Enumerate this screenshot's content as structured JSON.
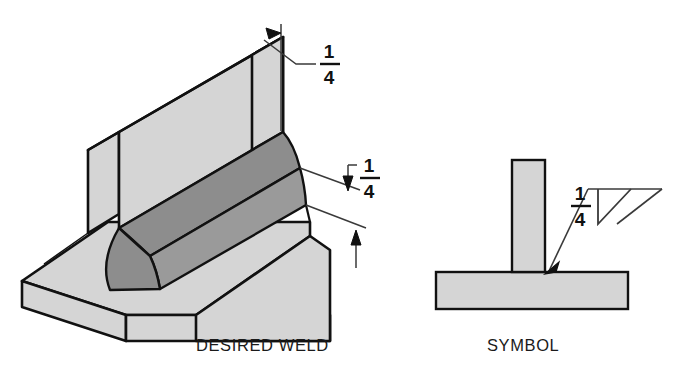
{
  "figure": {
    "background_color": "#ffffff",
    "line_color": "#111111",
    "plate_fill": "#d5d5d5",
    "weld_fill": "#8d8d8d",
    "weld_face_fill": "#9a9a9a",
    "thin_line_color": "#3a3a3a"
  },
  "panels": [
    {
      "id": "desired-weld",
      "caption": "DESIRED WELD",
      "caption_x": 196,
      "caption_y": 351
    },
    {
      "id": "symbol",
      "caption": "SYMBOL",
      "caption_x": 487,
      "caption_y": 351
    }
  ],
  "dimensions": [
    {
      "id": "leg-size-vertical",
      "numerator": "1",
      "denominator": "4",
      "numerator_x": 329,
      "numerator_y": 58,
      "bar_x1": 320,
      "bar_x2": 340,
      "bar_y": 64,
      "denominator_x": 329,
      "denominator_y": 84,
      "description": "Vertical fillet leg size one quarter inch"
    },
    {
      "id": "leg-size-horizontal",
      "numerator": "1",
      "denominator": "4",
      "numerator_x": 369,
      "numerator_y": 172,
      "bar_x1": 360,
      "bar_x2": 380,
      "bar_y": 178,
      "denominator_x": 369,
      "denominator_y": 198,
      "description": "Horizontal fillet leg size one quarter inch"
    },
    {
      "id": "symbol-weld-size",
      "numerator": "1",
      "denominator": "4",
      "numerator_x": 580,
      "numerator_y": 200,
      "bar_x1": 571,
      "bar_x2": 591,
      "bar_y": 206,
      "denominator_x": 580,
      "denominator_y": 226,
      "description": "Weld size one quarter inch shown left of fillet weld symbol"
    }
  ],
  "weld_symbol": {
    "reference_line_label": "reference-line",
    "fillet_triangle_label": "fillet-weld-triangle",
    "leader_label": "leader-line",
    "arrow_label": "leader-arrowhead"
  }
}
